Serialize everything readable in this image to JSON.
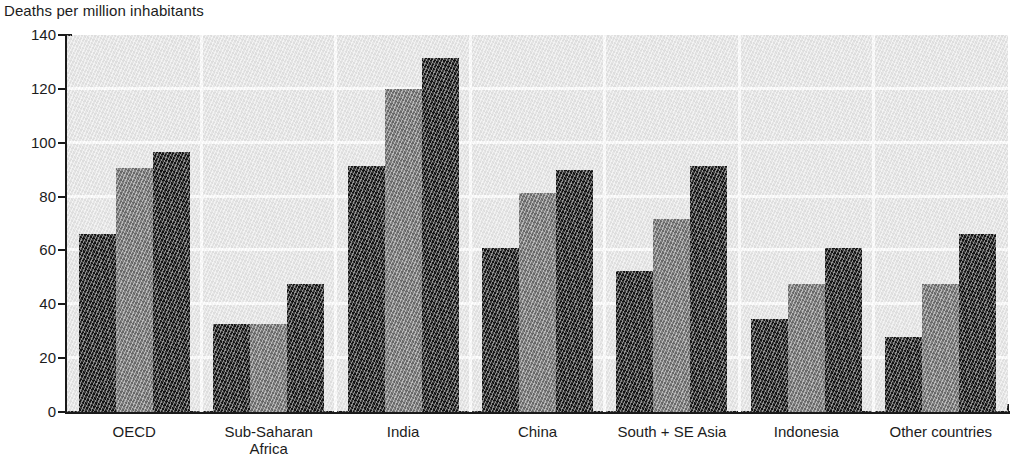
{
  "chart_data": {
    "type": "bar",
    "title": "Deaths per million inhabitants",
    "xlabel": "",
    "ylabel": "Deaths per million inhabitants",
    "ylim": [
      0,
      140
    ],
    "ytick_values": [
      0,
      20,
      40,
      60,
      80,
      100,
      120,
      140
    ],
    "ytick_labels": [
      "0",
      "20",
      "40",
      "60",
      "80",
      "100",
      "120",
      "140"
    ],
    "grid": "horizontal-and-group-separators",
    "legend": "none",
    "categories": [
      "OECD",
      "Sub-Saharan\nAfrica",
      "India",
      "China",
      "South + SE Asia",
      "Indonesia",
      "Other countries"
    ],
    "series": [
      {
        "name": "series-1",
        "color": "#131313",
        "values": [
          66,
          32.5,
          91.5,
          61,
          52.5,
          34.5,
          28
        ]
      },
      {
        "name": "series-2",
        "color": "#6d6d6d",
        "values": [
          90.5,
          32.5,
          120,
          81.5,
          71.5,
          47.5,
          47.5
        ]
      },
      {
        "name": "series-3",
        "color": "#131313",
        "values": [
          96.5,
          47.5,
          131.5,
          90,
          91.5,
          61,
          66
        ]
      }
    ]
  },
  "colors": {
    "dark_bar": "#131313",
    "light_bar": "#6d6d6d",
    "plot_background": "#e9e9e9",
    "gridline": "#ffffff",
    "axis": "#1a1a1a",
    "text": "#1c1c1c"
  }
}
